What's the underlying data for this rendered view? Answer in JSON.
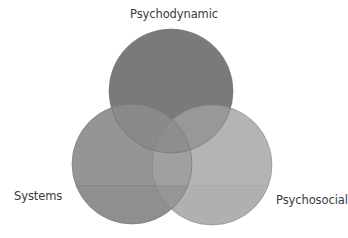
{
  "diagram": {
    "type": "venn",
    "sets": [
      {
        "id": "psychodynamic",
        "label": "Psychodynamic",
        "position": "top",
        "fill": "#7a7a7a",
        "center": [
          171,
          91
        ],
        "radius": 62
      },
      {
        "id": "systems",
        "label": "Systems",
        "position": "bottom-left",
        "fill": "#959595",
        "center": [
          132,
          164
        ],
        "radius": 60
      },
      {
        "id": "psychosocial",
        "label": "Psychosocial",
        "position": "bottom-right",
        "fill": "#b4b4b4",
        "center": [
          212,
          165
        ],
        "radius": 60
      }
    ],
    "outline_color": "#6a6a6a",
    "label_color": "#3a3a3a",
    "background": "#ffffff"
  }
}
